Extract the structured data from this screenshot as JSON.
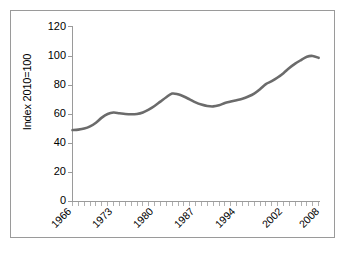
{
  "chart_data": {
    "type": "line",
    "title": "",
    "xlabel": "",
    "ylabel": "Index 2010=100",
    "ylim": [
      0,
      120
    ],
    "ytick_values": [
      0,
      20,
      40,
      60,
      80,
      100,
      120
    ],
    "ytick_labels": [
      "0",
      "20",
      "40",
      "60",
      "80",
      "100",
      "120"
    ],
    "xlim": [
      1966,
      2008
    ],
    "xtick_labels": [
      "1966",
      "1973",
      "1980",
      "1987",
      "1994",
      "2002",
      "2008"
    ],
    "xtick_values": [
      1966,
      1973,
      1980,
      1987,
      1994,
      2002,
      2008
    ],
    "xtick_rotation": -45,
    "minor_tick_interval": 1,
    "grid": false,
    "legend": null,
    "line_color": "#6b6b6b",
    "axis_color": "#9a9a9a",
    "frame_color": "#9a9a9a",
    "background_color": "#ffffff",
    "x": [
      1966,
      1967,
      1968,
      1969,
      1970,
      1971,
      1972,
      1973,
      1974,
      1975,
      1976,
      1977,
      1978,
      1979,
      1980,
      1981,
      1982,
      1983,
      1984,
      1985,
      1986,
      1987,
      1988,
      1989,
      1990,
      1991,
      1992,
      1993,
      1994,
      1995,
      1996,
      1997,
      1998,
      1999,
      2000,
      2001,
      2002,
      2003,
      2004,
      2005,
      2006,
      2007,
      2008
    ],
    "values": [
      49,
      49.3,
      50,
      51.5,
      54,
      57.5,
      60,
      61,
      60.5,
      60,
      59.8,
      60,
      61,
      63,
      65.5,
      68.5,
      71.5,
      74,
      73.5,
      72,
      70,
      68,
      66.5,
      65.5,
      65.2,
      66,
      67.5,
      68.5,
      69.5,
      70.5,
      72,
      74,
      77,
      80.5,
      82.5,
      85,
      88,
      91.5,
      94.5,
      97,
      99.3,
      99.8,
      98.5
    ]
  }
}
